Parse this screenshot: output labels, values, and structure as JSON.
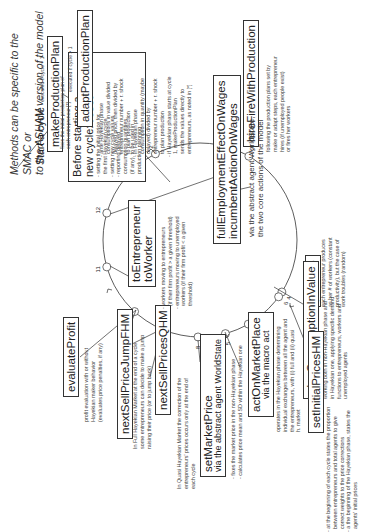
{
  "title": {
    "line1": "Methods can be specific to the SMAC or",
    "line2": "to the ASHAM version of the model"
  },
  "start_label": "Start a cycle",
  "reset": {
    "heading1": "Before starting a",
    "heading2_prefix": "new cycle: ",
    "heading2_bold": "reset",
    "notes": [
      "- setting the initial price for",
      "  the first Hayekian cycle",
      "- setting new cycle values",
      "- reporting delayed",
      "  consumption quantities",
      "  (if any), to be used in",
      "  production planning"
    ]
  },
  "steps": [
    {
      "num": "1",
      "name": "makeProductionPlan",
      "condition": "executed if cycle = 1",
      "notes": [
        "fixes the initial production plan of",
        "each entrepreneur [*]"
      ]
    },
    {
      "num": "2",
      "name": "adaptProductionPlan",
      "condition": "executed if cycle > 1",
      "notes": [
        "- ante Hayekian phase",
        "  consumptions in value divided",
        "  delayed price, then divided by",
        "  entrepreneur number + r. shock",
        "  to plan production",
        "- in Hayekian phase",
        "  consumption in quantity (maybe",
        "  delayed) divided by",
        "  entrepreneur number + r. shock",
        "  to plan production",
        "- if Hayekian phase starts at cycle",
        "  1, makeProductionPlan",
        "  sends the values directly to",
        "  entrepreneurs, as noted in [*]"
      ]
    },
    {
      "num": "3",
      "name": "hireFireWithProduction",
      "notes": [
        "following the production plans set by",
        "make or adapt steps, each entrepreneur",
        "hires (if unemployed people exist)",
        "or fires her workers"
      ]
    },
    {
      "num": "4",
      "name": "produce",
      "notes": [
        "each entrepreneur produces",
        "as her # of workers (constant",
        "productivity), but the case of",
        "work troubles (random)"
      ]
    },
    {
      "num": "5",
      "name": "planConsumptionInValue",
      "notes": [
        "working both in non-Hayekian phase and",
        "in Hayekian one, applying specific demand",
        "functions to entrepreneurs, workers and",
        "unemployed agents"
      ]
    },
    {
      "num": "6",
      "name": "setInitialPricesHM",
      "notes": [
        "- at the beginning of each cycle states the proportion",
        "  between entrepreneurs and total agents to give",
        "  correct weights to the price corrections",
        "- a the beginning of the Hayekian phase, states the",
        "  agents' initial prices"
      ]
    },
    {
      "num": "7",
      "name": "actOnMarketPlace",
      "subtitle": "via the macro act",
      "notes": [
        "operates in the Hayekian phase determining",
        "individual exchanges between all the agent and",
        "the entrepreneurs, with (i) full and (ii) quasi",
        "h. market"
      ]
    },
    {
      "num": "8",
      "name": "setMarketPrice",
      "subtitle": "via the abstract agent WorldState",
      "notes": [
        "- fixes the market price in the non-Hayekian phase",
        "- calculates price mean and SD within the Hayekian one"
      ]
    },
    {
      "num": "9",
      "name": "nextSellPriceJumpFHM",
      "branch": "full",
      "notes": [
        "In Full Hayekian Market at the end of a cycle",
        "some entrepreneurs can decide to make a jump",
        "raising their price (or to jump back)"
      ]
    },
    {
      "num": "9",
      "name": "nextSellPricesQHM",
      "branch": "quasi",
      "notes": [
        "In Quasi Hayekian Market the correction of the",
        "entrepreneurs' prices occurs only at the end of",
        "each cycle"
      ]
    },
    {
      "num": "10",
      "name": "evaluateProfit",
      "notes": [
        "profit evaluation with or without",
        "Hayekian maker behavior",
        "(evaluates price penalties, if any)"
      ]
    },
    {
      "num": "11",
      "name": "toEntrepreneur",
      "name2": "toWorker",
      "notes": [
        "- workers moving to entrepreneurs",
        "  (if their firm profit > a given threshold)",
        "- entrepreneurs moving to unemployed",
        "  workers (if their firm profit < a given",
        "  threshold)"
      ]
    },
    {
      "num": "12",
      "name": "fullEmploymentEffectOnWages",
      "name2": "incumbentActionOnWages",
      "notes": [
        "via the abstract agent WorldState,",
        "the two core actions of the model"
      ]
    }
  ],
  "circle_markers": [
    "1",
    "2",
    "3",
    "4",
    "5",
    "6",
    "7",
    "8",
    "9",
    "10",
    "11",
    "12"
  ]
}
